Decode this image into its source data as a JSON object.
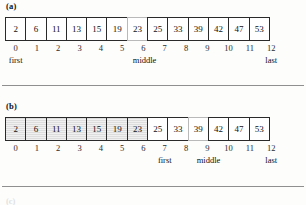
{
  "figure": {
    "array_values": [
      2,
      6,
      11,
      13,
      15,
      19,
      23,
      25,
      33,
      39,
      42,
      47,
      53
    ],
    "indices": [
      0,
      1,
      2,
      3,
      4,
      5,
      6,
      7,
      8,
      9,
      10,
      11,
      12
    ],
    "labels": {
      "first": "first",
      "middle": "middle",
      "last": "last"
    },
    "colors": {
      "cell_border": "#2a2a2a",
      "cell_background": "#ffffff",
      "shaded_background": "#dddddd",
      "rule": "#8f8f8f",
      "text": "#111111"
    }
  },
  "panels": [
    {
      "label": "(a)",
      "cells": [
        {
          "value": "2",
          "shaded": false,
          "faint": false
        },
        {
          "value": "6",
          "shaded": false,
          "faint": false
        },
        {
          "value": "11",
          "shaded": false,
          "faint": false
        },
        {
          "value": "13",
          "shaded": false,
          "faint": false
        },
        {
          "value": "15",
          "shaded": false,
          "faint": false
        },
        {
          "value": "19",
          "shaded": false,
          "faint": false
        },
        {
          "value": "23",
          "shaded": false,
          "faint": true
        },
        {
          "value": "25",
          "shaded": false,
          "faint": false
        },
        {
          "value": "33",
          "shaded": false,
          "faint": false
        },
        {
          "value": "39",
          "shaded": false,
          "faint": false
        },
        {
          "value": "42",
          "shaded": false,
          "faint": false
        },
        {
          "value": "47",
          "shaded": false,
          "faint": false
        },
        {
          "value": "53",
          "shaded": false,
          "faint": false
        }
      ],
      "indices": [
        "0",
        "1",
        "2",
        "3",
        "4",
        "5",
        "6",
        "7",
        "8",
        "9",
        "10",
        "11",
        "12"
      ],
      "pointers": [
        "first",
        "",
        "",
        "",
        "",
        "",
        "middle",
        "",
        "",
        "",
        "",
        "",
        "last"
      ]
    },
    {
      "label": "(b)",
      "cells": [
        {
          "value": "2",
          "shaded": true,
          "faint": false
        },
        {
          "value": "6",
          "shaded": true,
          "faint": false
        },
        {
          "value": "11",
          "shaded": true,
          "faint": false
        },
        {
          "value": "13",
          "shaded": true,
          "faint": false
        },
        {
          "value": "15",
          "shaded": true,
          "faint": false
        },
        {
          "value": "19",
          "shaded": true,
          "faint": false
        },
        {
          "value": "23",
          "shaded": true,
          "faint": false
        },
        {
          "value": "25",
          "shaded": false,
          "faint": false
        },
        {
          "value": "33",
          "shaded": false,
          "faint": false
        },
        {
          "value": "39",
          "shaded": false,
          "faint": true
        },
        {
          "value": "42",
          "shaded": false,
          "faint": false
        },
        {
          "value": "47",
          "shaded": false,
          "faint": false
        },
        {
          "value": "53",
          "shaded": false,
          "faint": false
        }
      ],
      "indices": [
        "0",
        "1",
        "2",
        "3",
        "4",
        "5",
        "6",
        "7",
        "8",
        "9",
        "10",
        "11",
        "12"
      ],
      "pointers": [
        "",
        "",
        "",
        "",
        "",
        "",
        "",
        "first",
        "",
        "middle",
        "",
        "",
        "last"
      ]
    }
  ],
  "next_panel_label": "(c)"
}
